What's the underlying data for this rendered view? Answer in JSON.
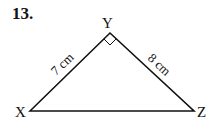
{
  "problem": {
    "number": "13."
  },
  "triangle": {
    "vertices": {
      "X": "X",
      "Y": "Y",
      "Z": "Z"
    },
    "sides": {
      "XY": "7 cm",
      "YZ": "8 cm"
    },
    "right_angle_at": "Y",
    "line_color": "#111111"
  }
}
